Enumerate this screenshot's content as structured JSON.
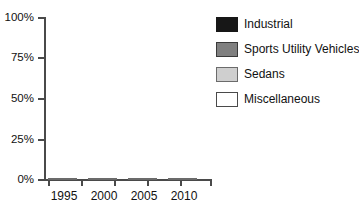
{
  "chart_data": {
    "type": "bar",
    "subtype": "stacked-percentage-column",
    "title": "",
    "xlabel": "",
    "ylabel": "",
    "categories": [
      "1995",
      "2000",
      "2005",
      "2010"
    ],
    "ylim": [
      0,
      100
    ],
    "y_unit": "%",
    "y_ticks": [
      0,
      25,
      50,
      75,
      100
    ],
    "y_tick_labels": [
      "0%",
      "25%",
      "50%",
      "75%",
      "100%"
    ],
    "grid": false,
    "legend_position": "right",
    "stack_order_bottom_to_top": [
      "Miscellaneous",
      "Sedans",
      "Sports Utility Vehicles",
      "Industrial"
    ],
    "series": [
      {
        "name": "Industrial",
        "color": "#171717",
        "values": [
          56,
          30,
          25,
          60
        ]
      },
      {
        "name": "Sports Utility Vehicles",
        "color": "#808080",
        "values": [
          14,
          26,
          25,
          7
        ]
      },
      {
        "name": "Sedans",
        "color": "#cfcfcf",
        "values": [
          25,
          19,
          25,
          30
        ]
      },
      {
        "name": "Miscellaneous",
        "color": "#ffffff",
        "values": [
          5,
          25,
          25,
          3
        ]
      }
    ]
  },
  "axes": {
    "y_tick_labels": [
      "100%",
      "75%",
      "50%",
      "25%",
      "0%"
    ],
    "x_tick_labels": [
      "1995",
      "2000",
      "2005",
      "2010"
    ]
  },
  "legend": {
    "items": [
      {
        "label": "Industrial",
        "swatch": "industrial",
        "color": "#171717"
      },
      {
        "label": "Sports Utility Vehicles",
        "swatch": "suv",
        "color": "#808080"
      },
      {
        "label": "Sedans",
        "swatch": "sedans",
        "color": "#cfcfcf"
      },
      {
        "label": "Miscellaneous",
        "swatch": "misc",
        "color": "#ffffff"
      }
    ]
  }
}
